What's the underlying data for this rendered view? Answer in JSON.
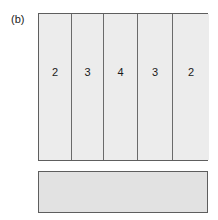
{
  "figure": {
    "panel_label": "(b)",
    "background_color": "#ffffff",
    "border_color": "#5e5e5e",
    "divider_color": "#6a6a6a",
    "block_fill_color": "#ececec",
    "bar_fill_color": "#e2e2e2",
    "text_color": "#1a1a1a"
  },
  "main_block": {
    "columns": [
      {
        "label": "2"
      },
      {
        "label": "3"
      },
      {
        "label": "4"
      },
      {
        "label": "3"
      },
      {
        "label": "2"
      }
    ]
  },
  "lower_bar": {
    "label": ""
  },
  "chart_data": {
    "type": "bar",
    "title": "(b)",
    "categories": [
      "1",
      "2",
      "3",
      "4",
      "5"
    ],
    "values": [
      2,
      3,
      4,
      3,
      2
    ],
    "xlabel": "",
    "ylabel": "",
    "annotations": [
      "2",
      "3",
      "4",
      "3",
      "2"
    ],
    "grid": false,
    "legend": "none"
  }
}
